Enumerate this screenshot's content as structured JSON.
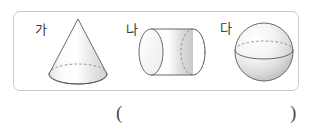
{
  "problem": {
    "panel": {
      "border_color": "#c9c9c9",
      "background": "#ffffff"
    },
    "solids": [
      {
        "label": "가",
        "shape_name": "cone",
        "icon": "cone-3d-icon",
        "outline_color": "#555555",
        "fill_light": "#ffffff",
        "fill_dark": "#cfcfcf",
        "hidden_edge_style": "dashed"
      },
      {
        "label": "나",
        "shape_name": "cylinder",
        "icon": "cylinder-3d-icon",
        "outline_color": "#555555",
        "fill_light": "#ffffff",
        "fill_dark": "#c8c8c8",
        "hidden_edge_style": "dashed"
      },
      {
        "label": "다",
        "shape_name": "sphere",
        "icon": "sphere-3d-icon",
        "outline_color": "#555555",
        "fill_light": "#ffffff",
        "fill_dark": "#c2c2c2",
        "hidden_edge_style": "dashed"
      }
    ],
    "answer_blank": {
      "open_paren": "(",
      "close_paren": ")",
      "value": ""
    }
  }
}
